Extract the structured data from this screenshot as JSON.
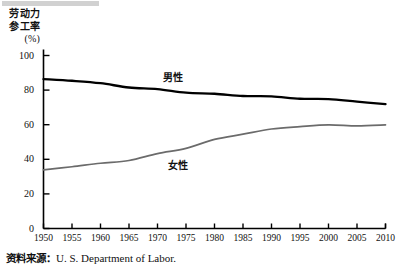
{
  "figure": {
    "axis_title_lines": [
      "劳动力",
      "参工率"
    ],
    "axis_title_unit": "(%)",
    "source_prefix": "资料来源：",
    "source_text": "U. S.  Department of Labor.",
    "colors": {
      "male_line": "#000000",
      "female_line": "#6b6b6b",
      "axis": "#000000",
      "background": "#ffffff"
    }
  },
  "chart_data": {
    "type": "line",
    "title": "",
    "xlabel": "",
    "ylabel": "劳动力参工率 (%)",
    "xlim": [
      1950,
      2010
    ],
    "ylim": [
      0,
      100
    ],
    "grid": false,
    "legend": "inline-annotations",
    "xticks": [
      1950,
      1955,
      1960,
      1965,
      1970,
      1975,
      1980,
      1985,
      1990,
      1995,
      2000,
      2005,
      2010
    ],
    "yticks": [
      0,
      20,
      40,
      60,
      80,
      100
    ],
    "x": [
      1950,
      1955,
      1960,
      1965,
      1970,
      1975,
      1980,
      1985,
      1990,
      1995,
      2000,
      2005,
      2010
    ],
    "series": [
      {
        "name": "男性",
        "label": "男性",
        "color": "#000000",
        "values": [
          86.4,
          85.4,
          84.0,
          81.5,
          80.6,
          78.5,
          77.9,
          76.6,
          76.4,
          75.0,
          74.8,
          73.3,
          71.9
        ]
      },
      {
        "name": "女性",
        "label": "女性",
        "color": "#6b6b6b",
        "values": [
          33.9,
          35.7,
          37.7,
          39.3,
          43.3,
          46.3,
          51.5,
          54.5,
          57.5,
          58.9,
          59.9,
          59.3,
          59.9
        ]
      }
    ]
  }
}
